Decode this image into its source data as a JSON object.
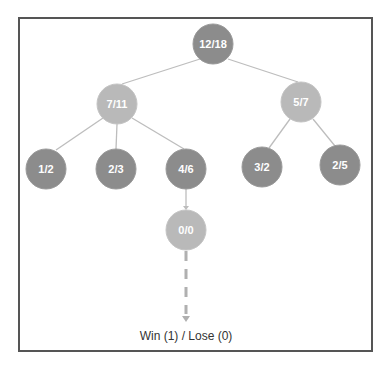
{
  "diagram": {
    "type": "tree",
    "title": "",
    "colors": {
      "dark_node": "#8c8c8c",
      "light_node": "#b9b9b9",
      "edge": "#bdbdbd",
      "frame": "#555555",
      "label_text": "#ffffff"
    },
    "nodes": [
      {
        "id": "root",
        "label": "12/18",
        "shade": "dark",
        "x": 213,
        "y": 44
      },
      {
        "id": "n1",
        "label": "7/11",
        "shade": "light",
        "x": 117,
        "y": 104
      },
      {
        "id": "n2",
        "label": "5/7",
        "shade": "light",
        "x": 301,
        "y": 102
      },
      {
        "id": "n11",
        "label": "1/2",
        "shade": "dark",
        "x": 46,
        "y": 169
      },
      {
        "id": "n12",
        "label": "2/3",
        "shade": "dark",
        "x": 116,
        "y": 169
      },
      {
        "id": "n13",
        "label": "4/6",
        "shade": "dark",
        "x": 186,
        "y": 169
      },
      {
        "id": "n21",
        "label": "3/2",
        "shade": "dark",
        "x": 262,
        "y": 167
      },
      {
        "id": "n22",
        "label": "2/5",
        "shade": "dark",
        "x": 340,
        "y": 165
      },
      {
        "id": "n131",
        "label": "0/0",
        "shade": "light",
        "x": 186,
        "y": 230
      }
    ],
    "edges": [
      {
        "from": "root",
        "to": "n1"
      },
      {
        "from": "root",
        "to": "n2"
      },
      {
        "from": "n1",
        "to": "n11"
      },
      {
        "from": "n1",
        "to": "n12"
      },
      {
        "from": "n1",
        "to": "n13"
      },
      {
        "from": "n2",
        "to": "n21"
      },
      {
        "from": "n2",
        "to": "n22"
      },
      {
        "from": "n13",
        "to": "n131"
      }
    ],
    "simulation": {
      "from": "n131",
      "style": "dashed-arrow",
      "outcome_label": "Win (1) / Lose (0)"
    }
  }
}
